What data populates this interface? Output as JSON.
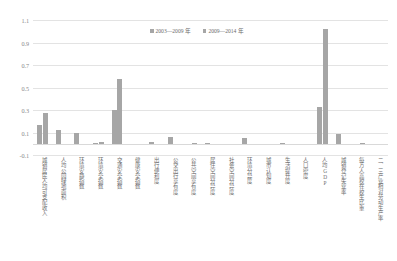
{
  "chart": {
    "type": "bar",
    "title": "",
    "legend_position": "top-center"
  },
  "legend": {
    "items": [
      {
        "label": "2003—2009 年",
        "color": "#a6a6a6"
      },
      {
        "label": "2009—2014 年",
        "color": "#a6a6a6"
      }
    ]
  },
  "yaxis": {
    "ticks": [
      "1.1",
      "0.9",
      "0.7",
      "0.5",
      "0.3",
      "0.1",
      "-0.1"
    ]
  },
  "chart_data": {
    "type": "bar",
    "title": "",
    "xlabel": "",
    "ylabel": "",
    "ylim": [
      -0.1,
      1.1
    ],
    "ytick_values": [
      1.1,
      0.9,
      0.7,
      0.5,
      0.3,
      0.1,
      -0.1
    ],
    "grid": true,
    "legend": [
      "2003—2009 年",
      "2009—2014 年"
    ],
    "categories": [
      "城镇居民人均可支配收入",
      "人均公园绿地面积",
      "环境安静指数",
      "环境安全指数",
      "交通安全指数",
      "健康安全指数",
      "出行便利度",
      "公交出行享有度",
      "公共空间享有度",
      "居住空间分异度",
      "社会空间分异度",
      "环境分异度",
      "城市认知度",
      "生活提升度",
      "人口密度",
      "人均GDP",
      "城镇登记失业率",
      "每万人高校在校生比重",
      "二、三产业相对劳动生产率"
    ],
    "series": [
      {
        "name": "2003—2009 年",
        "color": "#a6a6a6",
        "values": [
          0.17,
          0.12,
          0.1,
          0.01,
          0.3,
          0.0,
          0.02,
          0.06,
          0.0,
          0.01,
          0.0,
          0.05,
          0.0,
          0.01,
          0.0,
          0.33,
          0.09,
          0.0,
          0.0
        ]
      },
      {
        "name": "2009—2014 年",
        "color": "#a6a6a6",
        "values": [
          0.27,
          0.0,
          0.0,
          0.02,
          0.58,
          0.0,
          0.0,
          0.0,
          0.01,
          0.0,
          0.0,
          0.0,
          0.0,
          0.0,
          0.0,
          1.02,
          0.0,
          0.01,
          0.0
        ]
      }
    ]
  }
}
